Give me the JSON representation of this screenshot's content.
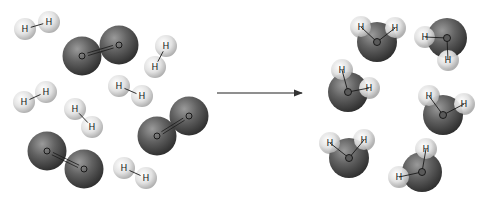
{
  "diagram": {
    "type": "chemical-reaction",
    "colors": {
      "background": "#ffffff",
      "hydrogen_light": "#f4f4f4",
      "hydrogen_dark": "#b8b8b8",
      "oxygen_light": "#8a8a8a",
      "oxygen_dark": "#3a3a3a",
      "arrow": "#555555"
    },
    "labels": {
      "hydrogen": "H",
      "oxygen": "O"
    },
    "reactants": {
      "hydrogen_molecules": [
        {
          "atoms": [
            [
              25,
              29
            ],
            [
              49,
              22
            ]
          ]
        },
        {
          "atoms": [
            [
              166,
              46
            ],
            [
              155,
              67
            ]
          ]
        },
        {
          "atoms": [
            [
              24,
              102
            ],
            [
              46,
              92
            ]
          ]
        },
        {
          "atoms": [
            [
              75,
              109
            ],
            [
              92,
              127
            ]
          ]
        },
        {
          "atoms": [
            [
              119,
              86
            ],
            [
              142,
              96
            ]
          ]
        },
        {
          "atoms": [
            [
              124,
              168
            ],
            [
              146,
              178
            ]
          ]
        }
      ],
      "oxygen_molecules": [
        {
          "atoms": [
            [
              82,
              56
            ],
            [
              119,
              45
            ]
          ]
        },
        {
          "atoms": [
            [
              157,
              136
            ],
            [
              189,
              116
            ]
          ]
        },
        {
          "atoms": [
            [
              47,
              151
            ],
            [
              84,
              169
            ]
          ]
        }
      ]
    },
    "arrow": {
      "x1": 217,
      "y1": 93,
      "x2": 302,
      "y2": 93
    },
    "products": {
      "water_molecules": [
        {
          "o": [
            377,
            42
          ],
          "h": [
            [
              361,
              27
            ],
            [
              395,
              28
            ]
          ]
        },
        {
          "o": [
            447,
            38
          ],
          "h": [
            [
              425,
              37
            ],
            [
              448,
              60
            ]
          ]
        },
        {
          "o": [
            348,
            92
          ],
          "h": [
            [
              342,
              70
            ],
            [
              369,
              88
            ]
          ]
        },
        {
          "o": [
            443,
            115
          ],
          "h": [
            [
              429,
              96
            ],
            [
              464,
              104
            ]
          ]
        },
        {
          "o": [
            349,
            158
          ],
          "h": [
            [
              330,
              143
            ],
            [
              364,
              140
            ]
          ]
        },
        {
          "o": [
            422,
            172
          ],
          "h": [
            [
              426,
              149
            ],
            [
              399,
              177
            ]
          ]
        }
      ]
    }
  }
}
